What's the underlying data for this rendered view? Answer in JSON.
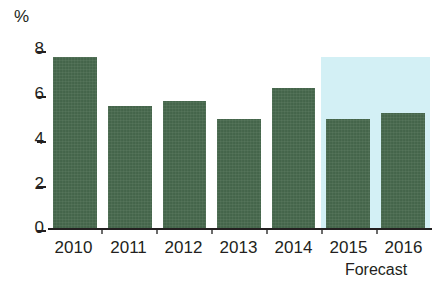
{
  "chart_data": {
    "type": "bar",
    "title": "",
    "subtitle": "",
    "xlabel": "",
    "ylabel": "%",
    "axis_unit": "%",
    "categories": [
      "2010",
      "2011",
      "2012",
      "2013",
      "2014",
      "2015",
      "2016"
    ],
    "values": [
      7.3,
      5.2,
      5.4,
      4.65,
      5.95,
      4.65,
      4.9
    ],
    "series": [
      {
        "name": "Growth",
        "values": [
          7.3,
          5.2,
          5.4,
          4.65,
          5.95,
          4.65,
          4.9
        ]
      }
    ],
    "ylim": [
      0,
      8
    ],
    "yticks": [
      0,
      2,
      4,
      6,
      8
    ],
    "ytick_labels": [
      "0",
      "2",
      "4",
      "6",
      "8"
    ],
    "grid": false,
    "legend": null,
    "annotations": [
      {
        "text": "Forecast",
        "applies_to": [
          "2015",
          "2016"
        ],
        "position": "below-axis-right"
      }
    ],
    "highlight_band": {
      "label": "Forecast",
      "from_category": "2015",
      "to_category": "2016",
      "color": "#d3f0f5"
    },
    "bar_color": "#47694d",
    "axis_color": "#231f20"
  },
  "colors": {
    "bar": "#47694d",
    "forecast_band": "#d3f0f5",
    "axis": "#231f20",
    "background": "#ffffff"
  },
  "forecast_caption": "Forecast"
}
